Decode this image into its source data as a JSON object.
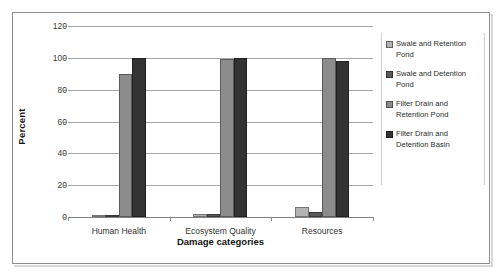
{
  "chart_data": {
    "type": "bar",
    "title": "",
    "subtitle": "",
    "xlabel": "Damage categories",
    "ylabel": "Percent",
    "categories": [
      "Human Health",
      "Ecosystem Quality",
      "Resources"
    ],
    "series": [
      {
        "name": "Swale and Retention Pond",
        "values": [
          1,
          2,
          6
        ],
        "color": "#b3b3b3"
      },
      {
        "name": "Swale and Detention Pond",
        "values": [
          1,
          2,
          3
        ],
        "color": "#595959"
      },
      {
        "name": "Filter Drain and Retention Pond",
        "values": [
          90,
          99,
          100
        ],
        "color": "#8c8c8c"
      },
      {
        "name": "Filter Drain and Detention Basin",
        "values": [
          100,
          100,
          98
        ],
        "color": "#333333"
      }
    ],
    "ylim": [
      0,
      120
    ],
    "yticks": [
      0,
      20,
      40,
      60,
      80,
      100,
      120
    ],
    "ytick_labels": [
      "0",
      "20",
      "40",
      "60",
      "80",
      "100",
      "120"
    ],
    "grid": true,
    "grid_axis": "y",
    "legend_position": "right",
    "bar_orientation": "vertical"
  },
  "axis": {
    "y_title": "Percent",
    "x_title": "Damage categories",
    "y_ticks": [
      "120",
      "100",
      "80",
      "60",
      "40",
      "20",
      "0"
    ],
    "x_ticks": [
      "Human Health",
      "Ecosystem Quality",
      "Resources"
    ]
  },
  "legend": {
    "items": [
      {
        "label": "Swale and Retention Pond",
        "color": "#b3b3b3"
      },
      {
        "label": "Swale and Detention Pond",
        "color": "#595959"
      },
      {
        "label": "Filter Drain and Retention Pond",
        "color": "#8c8c8c"
      },
      {
        "label": "Filter Drain and Detention Basin",
        "color": "#333333"
      }
    ]
  },
  "colors": {
    "frame": "#8c8c8c",
    "gridline": "#a6a6a6",
    "axis": "#808080",
    "text": "#333333",
    "title_text": "#141414"
  }
}
